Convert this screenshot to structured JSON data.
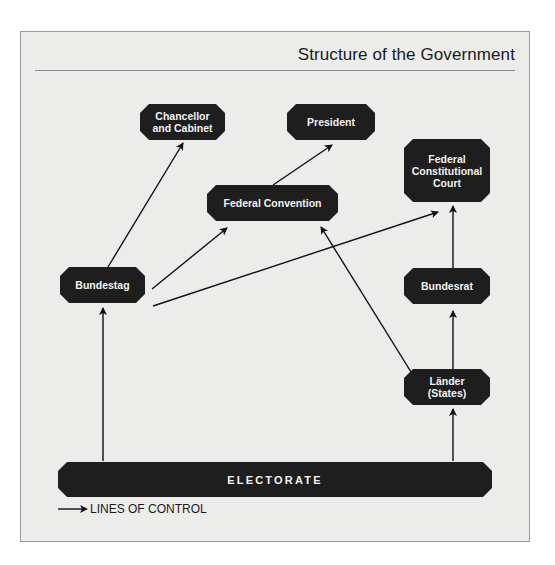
{
  "title": "Structure of the Government",
  "nodes": {
    "chancellor": "Chancellor\nand Cabinet",
    "president": "President",
    "fcc": "Federal\nConstitutional\nCourt",
    "convention": "Federal Convention",
    "bundestag": "Bundestag",
    "bundesrat": "Bundesrat",
    "laender": "Länder\n(States)",
    "electorate": "ELECTORATE"
  },
  "edges": [
    {
      "from": "Electorate",
      "to": "Bundestag"
    },
    {
      "from": "Electorate",
      "to": "Länder (States)"
    },
    {
      "from": "Länder (States)",
      "to": "Bundesrat"
    },
    {
      "from": "Länder (States)",
      "to": "Federal Convention"
    },
    {
      "from": "Bundesrat",
      "to": "Federal Constitutional Court"
    },
    {
      "from": "Bundestag",
      "to": "Chancellor and Cabinet"
    },
    {
      "from": "Bundestag",
      "to": "Federal Convention"
    },
    {
      "from": "Bundestag",
      "to": "Federal Constitutional Court"
    },
    {
      "from": "Federal Convention",
      "to": "President"
    }
  ],
  "legend": {
    "label": "LINES OF CONTROL"
  },
  "colors": {
    "node_fill": "#1e1e1e",
    "node_text": "#f2f2f2",
    "background": "#ececeb",
    "line": "#111111"
  }
}
